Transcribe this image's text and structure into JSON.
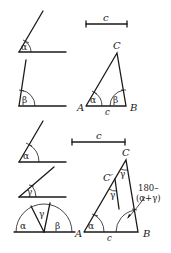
{
  "figure": {
    "top": {
      "given_angle_1": {
        "label": "α"
      },
      "given_angle_2": {
        "label": "β"
      },
      "given_segment": {
        "label": "c"
      },
      "triangle": {
        "vertices": {
          "a": "A",
          "b": "B",
          "c": "C"
        },
        "side_label": "c",
        "angle_a": "α",
        "angle_b": "β"
      }
    },
    "bottom": {
      "given_angle_1": {
        "label": "α"
      },
      "given_angle_2": {
        "label": "γ"
      },
      "semicircle_angles": [
        "α",
        "γ",
        "β"
      ],
      "given_segment": {
        "label": "c"
      },
      "triangle": {
        "vertices": {
          "a": "A",
          "b": "B",
          "c": "C",
          "c_prime": "C′"
        },
        "side_label": "c",
        "angle_a": "α",
        "angle_c_prime": "γ",
        "angle_c": "γ",
        "annotation_line1": "180–",
        "annotation_line2": "(α+γ)"
      }
    }
  }
}
